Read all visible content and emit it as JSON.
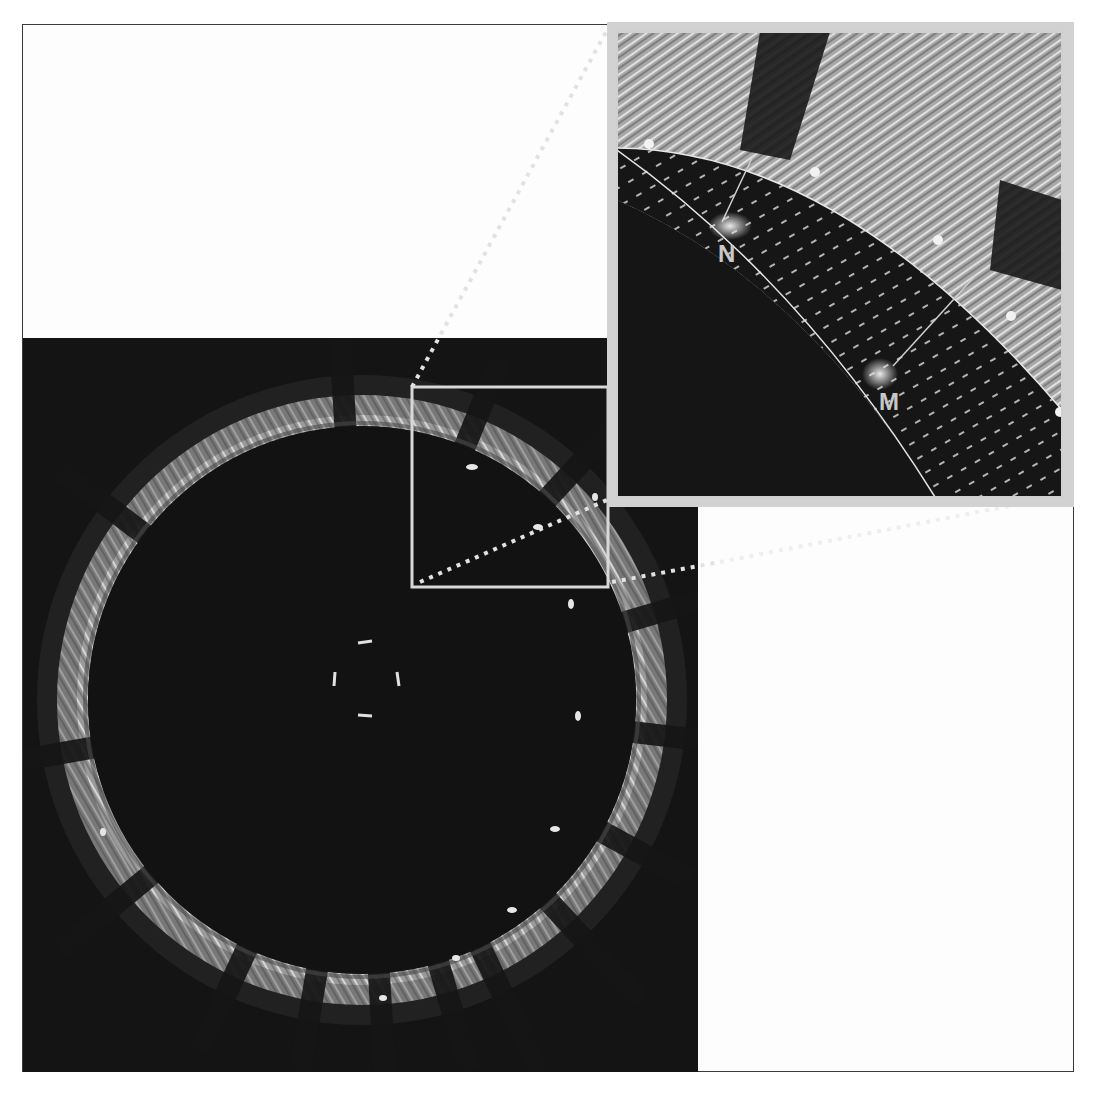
{
  "figure": {
    "type": "intravascular-ultrasound-cross-section",
    "main_image": {
      "description": "IVUS cross-section of vessel showing dark lumen, bright circular wall with radial stent strut shadows, central catheter marker",
      "zoom_box": {
        "x": 412,
        "y": 387,
        "w": 196,
        "h": 200
      }
    },
    "inset": {
      "description": "Magnified region with segmented wall band, vector-field arrows, boundary control points",
      "labels": {
        "n": "N",
        "m": "M"
      },
      "control_points": 5
    },
    "colors": {
      "background": "#ffffff",
      "image_dark": "#111111",
      "tissue_bright": "#bdbdbd",
      "box_outline": "#d8d8d8",
      "label_fill": "#c8c8c8"
    }
  }
}
